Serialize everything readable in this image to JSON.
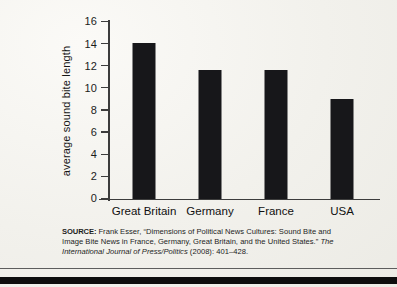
{
  "chart_data": {
    "type": "bar",
    "title": "",
    "xlabel": "",
    "ylabel": "average sound bite length",
    "categories": [
      "Great Britain",
      "Germany",
      "France",
      "USA"
    ],
    "values": [
      14.1,
      11.7,
      11.7,
      9.0
    ],
    "ylim": [
      0,
      16
    ],
    "yticks": [
      0,
      2,
      4,
      6,
      8,
      10,
      12,
      14,
      16
    ],
    "ytick_labels": [
      "0",
      "2",
      "4",
      "6",
      "8",
      "10",
      "12",
      "14",
      "16"
    ],
    "grid": false,
    "legend": "none",
    "bar_color": "#17171a",
    "axis_color": "#3c3c3c"
  },
  "source": {
    "kicker": "SOURCE:",
    "text_before_italic": " Frank Esser, “Dimensions of Political News Cultures: Sound Bite and Image Bite News in France, Germany, Great Britain, and the United States.” ",
    "italic": "The International Journal of Press/Politics",
    "text_after_italic": " (2008): 401–428."
  }
}
